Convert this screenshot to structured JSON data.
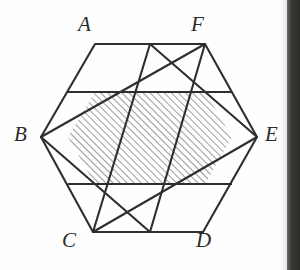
{
  "figure": {
    "name": "hexagon-star-hatched",
    "background_color": "#fefefe",
    "line_color": "#2e2e2e",
    "hatch_color": "#4a4a4a",
    "scan_band_color": "#2e2c2b"
  },
  "labels": [
    {
      "id": "A",
      "text": "A",
      "x": 78,
      "y": 14
    },
    {
      "id": "F",
      "text": "F",
      "x": 191,
      "y": 14
    },
    {
      "id": "B",
      "text": "B",
      "x": 14,
      "y": 124
    },
    {
      "id": "E",
      "text": "E",
      "x": 265,
      "y": 124
    },
    {
      "id": "C",
      "text": "C",
      "x": 62,
      "y": 230
    },
    {
      "id": "D",
      "text": "D",
      "x": 196,
      "y": 230
    }
  ],
  "geometry": {
    "outer_hexagon": {
      "name": "hexagon-ABCDEF",
      "points": "95,44 205,44 257,137 203,232 93,232 41,137"
    },
    "triangle_down": {
      "name": "triangle-apex-top",
      "points": "150,44 257,137 93,232"
    },
    "triangle_up": {
      "name": "triangle-apex-bottom",
      "points": "150,232 41,137 205,44"
    },
    "inner_hexagon": {
      "name": "hatched-inner-hexagon",
      "points": "95,92 205,92 232,137 205,184 95,184 68,137"
    },
    "chords": [
      {
        "name": "chord-upper-horizontal",
        "x1": 68,
        "y1": 92,
        "x2": 232,
        "y2": 92
      },
      {
        "name": "chord-lower-horizontal",
        "x1": 68,
        "y1": 184,
        "x2": 232,
        "y2": 184
      }
    ]
  },
  "hatching": {
    "angle_degrees": 45,
    "spacing_px": 5,
    "stroke_width": 1.1
  }
}
